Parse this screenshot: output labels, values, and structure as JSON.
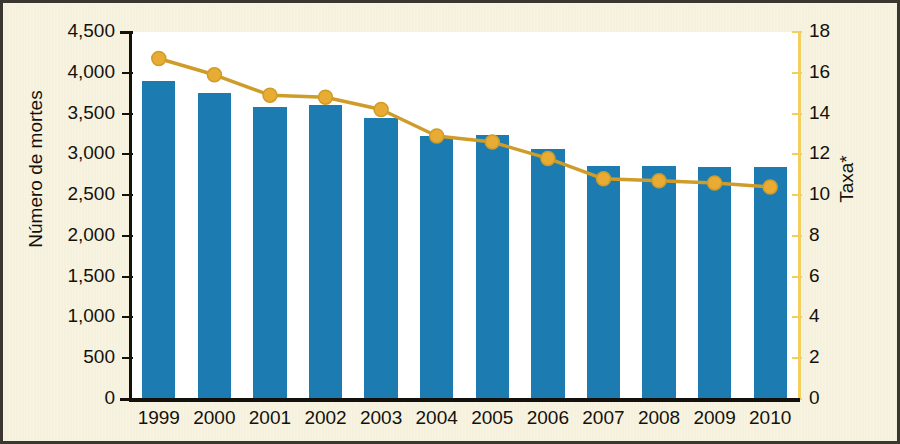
{
  "figure": {
    "background_color": "#f6f1dd",
    "plot_background_color": "#ffffff",
    "border_color": "#3a3630"
  },
  "chart_data": {
    "type": "bar",
    "title": "",
    "subtitle": "",
    "xlabel": "",
    "ylabel": "Número de mortes",
    "y2label": "Taxa*",
    "categories": [
      "1999",
      "2000",
      "2001",
      "2002",
      "2003",
      "2004",
      "2005",
      "2006",
      "2007",
      "2008",
      "2009",
      "2010"
    ],
    "ylim": [
      0,
      4500
    ],
    "y2lim": [
      0,
      18
    ],
    "yticks": [
      0,
      500,
      1000,
      1500,
      2000,
      2500,
      3000,
      3500,
      4000,
      4500
    ],
    "ytick_labels": [
      "0",
      "500",
      "1,000",
      "1,500",
      "2,000",
      "2,500",
      "3,000",
      "3,500",
      "4,000",
      "4,500"
    ],
    "y2ticks": [
      0,
      2,
      4,
      6,
      8,
      10,
      12,
      14,
      16,
      18
    ],
    "y2tick_labels": [
      "0",
      "2",
      "4",
      "6",
      "8",
      "10",
      "12",
      "14",
      "16",
      "18"
    ],
    "grid": false,
    "legend": "none",
    "series": [
      {
        "name": "Número de mortes",
        "type": "bar",
        "axis": "left",
        "color": "#1c7bb0",
        "values": [
          3900,
          3750,
          3580,
          3610,
          3450,
          3220,
          3240,
          3060,
          2860,
          2860,
          2850,
          2850
        ]
      },
      {
        "name": "Taxa*",
        "type": "line",
        "axis": "right",
        "color": "#cf9c29",
        "marker_color": "#e8ab33",
        "values": [
          16.7,
          15.9,
          14.9,
          14.8,
          14.2,
          12.9,
          12.6,
          11.8,
          10.8,
          10.7,
          10.6,
          10.4
        ]
      }
    ]
  }
}
